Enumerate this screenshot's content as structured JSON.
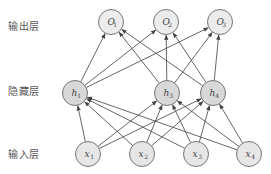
{
  "layers": {
    "output": {
      "label": "输出层",
      "y": 22,
      "fill": "#ececec"
    },
    "hidden": {
      "label": "隐藏层",
      "y": 93,
      "fill": "#d8d8d8"
    },
    "input": {
      "label": "输入层",
      "y": 154,
      "fill": "#e6e6e6"
    }
  },
  "nodes": {
    "output": [
      {
        "id": "O1",
        "base": "O",
        "sub": "1",
        "x": 111
      },
      {
        "id": "O2",
        "base": "O",
        "sub": "2",
        "x": 166
      },
      {
        "id": "O3",
        "base": "O",
        "sub": "3",
        "x": 220
      }
    ],
    "hidden": [
      {
        "id": "h1",
        "base": "h",
        "sub": "1",
        "x": 75
      },
      {
        "id": "h3",
        "base": "h",
        "sub": "3",
        "x": 167
      },
      {
        "id": "h4",
        "base": "h",
        "sub": "4",
        "x": 213
      }
    ],
    "input": [
      {
        "id": "x1",
        "base": "x",
        "sub": "1",
        "x": 88
      },
      {
        "id": "x2",
        "base": "x",
        "sub": "2",
        "x": 142
      },
      {
        "id": "x3",
        "base": "x",
        "sub": "3",
        "x": 196
      },
      {
        "id": "x4",
        "base": "x",
        "sub": "4",
        "x": 249
      }
    ]
  },
  "style": {
    "node_radius": 12.5,
    "node_stroke": "#777777",
    "edge_color": "#555555"
  }
}
